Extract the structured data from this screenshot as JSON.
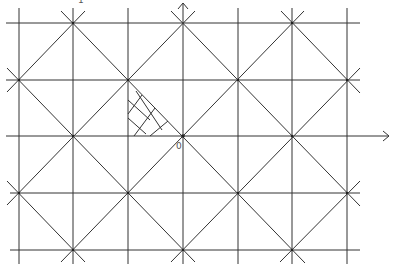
{
  "diagram": {
    "type": "lattice-tiling",
    "colors": {
      "line": "#333333",
      "background": "#ffffff",
      "label": "#555555"
    },
    "vertical_lines_x": [
      19,
      73,
      128,
      183,
      238,
      292,
      347
    ],
    "horizontal_lines_y": [
      23,
      80,
      136,
      193,
      250
    ],
    "origin": {
      "x": 183,
      "y": 136
    },
    "labels": {
      "origin": "0",
      "top": "1"
    },
    "axes": {
      "x_axis": {
        "from": [
          6,
          136
        ],
        "to": [
          390,
          136
        ],
        "arrow": true
      },
      "y_axis": {
        "from": [
          183,
          264
        ],
        "to": [
          183,
          2
        ],
        "arrow": true
      }
    },
    "shaded_triangle": {
      "vertices": [
        [
          128,
          80
        ],
        [
          128,
          136
        ],
        [
          183,
          136
        ]
      ],
      "fill": "crosshatch"
    }
  }
}
